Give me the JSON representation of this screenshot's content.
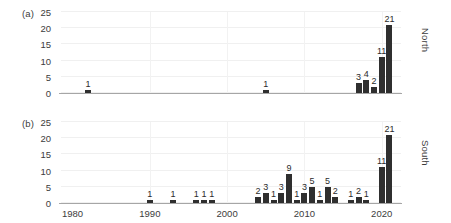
{
  "figure": {
    "width": 451,
    "height": 223,
    "bar_color": "#2f2f2f",
    "grid_color": "#f0f0f0",
    "axis_color": "#a6a6a6"
  },
  "panels": [
    {
      "tag": "(a)",
      "side_label": "North",
      "yticks": [
        "25",
        "20",
        "15",
        "10",
        "5",
        "0"
      ],
      "ylim": [
        0,
        25
      ],
      "xlim": [
        1978.5,
        2022.5
      ],
      "xticks": [
        "1980",
        "1990",
        "2000",
        "2010",
        "2020"
      ],
      "xtick_values": [
        1980,
        1990,
        2000,
        2010,
        2020
      ]
    },
    {
      "tag": "(b)",
      "side_label": "South",
      "yticks": [
        "25",
        "20",
        "15",
        "10",
        "5",
        "0"
      ],
      "ylim": [
        0,
        25
      ],
      "xlim": [
        1978.5,
        2022.5
      ],
      "xticks": [
        "1980",
        "1990",
        "2000",
        "2010",
        "2020"
      ],
      "xtick_values": [
        1980,
        1990,
        2000,
        2010,
        2020
      ]
    }
  ],
  "chart_data": [
    {
      "type": "bar",
      "title": "",
      "panel": "(a)",
      "series_name": "North",
      "xlabel": "",
      "ylabel": "",
      "ylim": [
        0,
        25
      ],
      "yticks": [
        0,
        5,
        10,
        15,
        20,
        25
      ],
      "xlim": [
        1978.5,
        2022.5
      ],
      "xticks": [
        1980,
        1990,
        2000,
        2010,
        2020
      ],
      "grid": true,
      "legend": "none",
      "categories": [
        1982,
        2005,
        2017,
        2018,
        2019,
        2020,
        2021
      ],
      "values": [
        1,
        1,
        3,
        4,
        2,
        11,
        21
      ],
      "data_labels": [
        "1",
        "1",
        "3",
        "4",
        "2",
        "11",
        "21"
      ]
    },
    {
      "type": "bar",
      "title": "",
      "panel": "(b)",
      "series_name": "South",
      "xlabel": "",
      "ylabel": "",
      "ylim": [
        0,
        25
      ],
      "yticks": [
        0,
        5,
        10,
        15,
        20,
        25
      ],
      "xlim": [
        1978.5,
        2022.5
      ],
      "xticks": [
        1980,
        1990,
        2000,
        2010,
        2020
      ],
      "grid": true,
      "legend": "none",
      "categories": [
        1990,
        1993,
        1996,
        1997,
        1998,
        2004,
        2005,
        2006,
        2007,
        2008,
        2009,
        2010,
        2011,
        2012,
        2013,
        2014,
        2016,
        2017,
        2018,
        2020,
        2021
      ],
      "values": [
        1,
        1,
        1,
        1,
        1,
        2,
        3,
        1,
        3,
        9,
        1,
        3,
        5,
        1,
        5,
        2,
        1,
        2,
        1,
        11,
        21
      ],
      "data_labels": [
        "1",
        "1",
        "1",
        "1",
        "1",
        "2",
        "3",
        "1",
        "3",
        "9",
        "1",
        "3",
        "5",
        "1",
        "5",
        "2",
        "1",
        "2",
        "1",
        "11",
        "21"
      ]
    }
  ]
}
